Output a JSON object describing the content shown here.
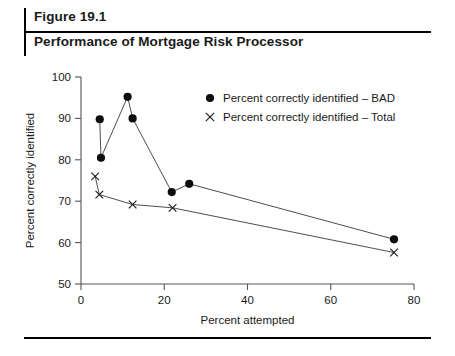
{
  "header": {
    "figure_number": "Figure 19.1",
    "title": "Performance of Mortgage Risk Processor"
  },
  "chart_data": {
    "type": "line",
    "title": "Performance of Mortgage Risk Processor",
    "xlabel": "Percent attempted",
    "ylabel": "Percent correctly identified",
    "xlim": [
      0,
      80
    ],
    "ylim": [
      50,
      100
    ],
    "xticks": [
      0,
      20,
      40,
      60,
      80
    ],
    "yticks": [
      50,
      60,
      70,
      80,
      90,
      100
    ],
    "grid": false,
    "legend_position": "upper-right-inside",
    "series": [
      {
        "name": "Percent correctly identified – BAD",
        "marker": "filled-circle",
        "points": [
          {
            "x": 4.5,
            "y": 89.8
          },
          {
            "x": 4.8,
            "y": 80.5
          },
          {
            "x": 11.2,
            "y": 95.2
          },
          {
            "x": 12.4,
            "y": 90.0
          },
          {
            "x": 21.8,
            "y": 72.2
          },
          {
            "x": 26.0,
            "y": 74.2
          },
          {
            "x": 75.2,
            "y": 60.8
          }
        ]
      },
      {
        "name": "Percent correctly identified – Total",
        "marker": "x",
        "points": [
          {
            "x": 3.4,
            "y": 76.0
          },
          {
            "x": 4.4,
            "y": 71.6
          },
          {
            "x": 12.4,
            "y": 69.2
          },
          {
            "x": 22.0,
            "y": 68.4
          },
          {
            "x": 75.2,
            "y": 57.6
          }
        ]
      }
    ],
    "legend": [
      {
        "label": "Percent correctly identified – BAD",
        "marker": "filled-circle"
      },
      {
        "label": "Percent correctly identified – Total",
        "marker": "x"
      }
    ]
  }
}
